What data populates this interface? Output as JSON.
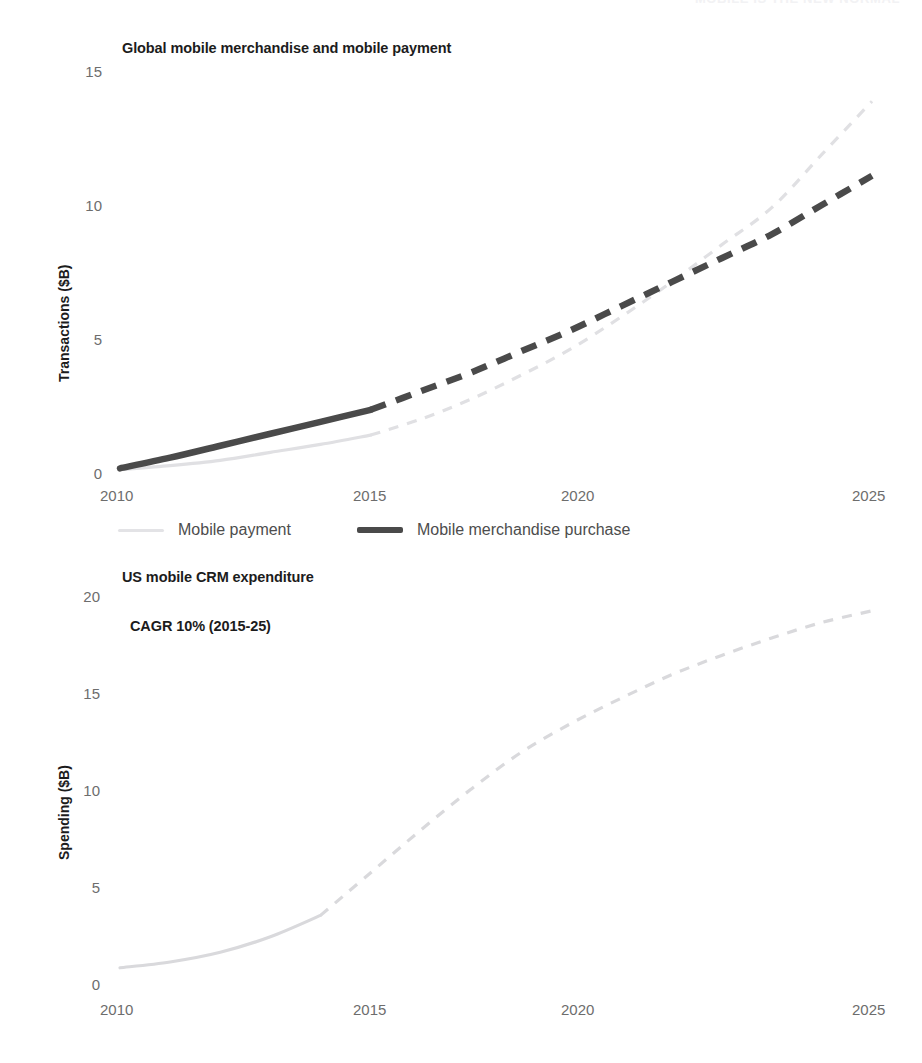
{
  "top_banner": {
    "text": "MOBILE IS THE NEW NORMAL"
  },
  "colors": {
    "light_series": "#e0e0e3",
    "dark_series": "#4a4a4a",
    "tick_text": "#6d6d6d",
    "title_text": "#1c1c1c",
    "legend_text": "#4d4d4d",
    "background": "#ffffff"
  },
  "chart_data": [
    {
      "id": "global-mobile",
      "type": "line",
      "title": "Global mobile merchandise and mobile payment",
      "xlabel": "",
      "ylabel": "Transactions ($B)",
      "xlim": [
        2010,
        2025
      ],
      "ylim": [
        0,
        15
      ],
      "xticks": [
        2010,
        2015,
        2020,
        2025
      ],
      "yticks": [
        0,
        5,
        10,
        15
      ],
      "grid": false,
      "legend_position": "below",
      "forecast_starts": 2015,
      "x": [
        2010,
        2011,
        2012,
        2013,
        2014,
        2015,
        2016,
        2017,
        2018,
        2019,
        2020,
        2021,
        2022,
        2023,
        2024,
        2025
      ],
      "series": [
        {
          "name": "Mobile payment",
          "color": "#e0e0e3",
          "style": "thin",
          "values": [
            0.05,
            0.2,
            0.4,
            0.7,
            1.0,
            1.35,
            1.95,
            2.7,
            3.6,
            4.6,
            5.8,
            7.1,
            8.5,
            9.9,
            11.9,
            13.9
          ]
        },
        {
          "name": "Mobile merchandise purchase",
          "color": "#4a4a4a",
          "style": "thick",
          "values": [
            0.1,
            0.5,
            0.95,
            1.4,
            1.85,
            2.3,
            3.0,
            3.7,
            4.5,
            5.3,
            6.2,
            7.1,
            8.0,
            8.9,
            10.0,
            11.1
          ]
        }
      ],
      "legend": [
        {
          "label": "Mobile payment",
          "swatch": "light"
        },
        {
          "label": "Mobile merchandise purchase",
          "swatch": "dark"
        }
      ]
    },
    {
      "id": "us-mobile-crm",
      "type": "line",
      "title": "US mobile CRM expenditure",
      "annotation": "CAGR 10% (2015-25)",
      "xlabel": "",
      "ylabel": "Spending ($B)",
      "xlim": [
        2010,
        2025
      ],
      "ylim": [
        0,
        20
      ],
      "xticks": [
        2010,
        2015,
        2020,
        2025
      ],
      "yticks": [
        0,
        5,
        10,
        15,
        20
      ],
      "grid": false,
      "legend_position": "none",
      "forecast_starts": 2014,
      "x": [
        2010,
        2011,
        2012,
        2013,
        2014,
        2015,
        2016,
        2017,
        2018,
        2019,
        2020,
        2021,
        2022,
        2023,
        2024,
        2025
      ],
      "series": [
        {
          "name": "US mobile CRM expenditure",
          "color": "#d9d9dc",
          "style": "thin",
          "values": [
            1.3,
            1.6,
            2.1,
            2.9,
            4.0,
            6.2,
            8.4,
            10.5,
            12.4,
            13.9,
            15.2,
            16.4,
            17.4,
            18.3,
            19.1,
            19.7
          ]
        }
      ],
      "legend": []
    }
  ]
}
